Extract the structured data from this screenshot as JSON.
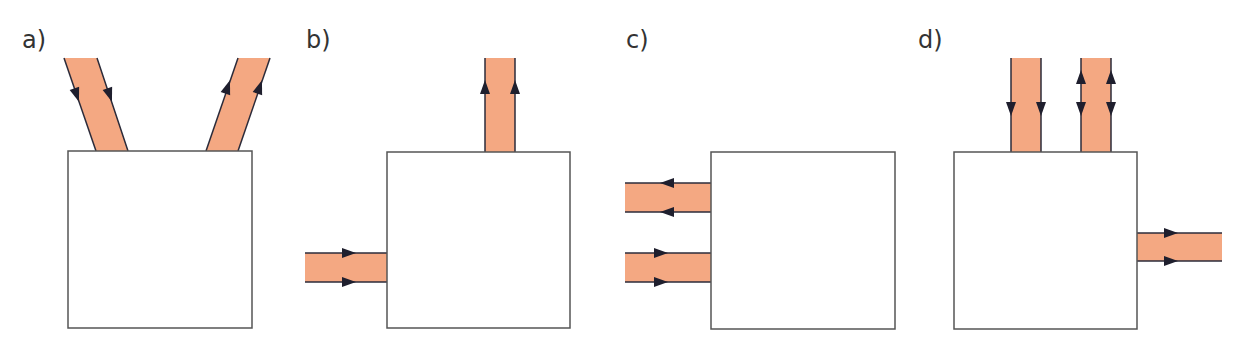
{
  "heading": {
    "text": "…"
  },
  "colors": {
    "pipe_fill": "#F4A882",
    "pipe_edge": "#2b2b3a",
    "box_border": "#555555",
    "arrow": "#1f1f2e",
    "label": "#333333"
  },
  "panels": [
    {
      "id": "a",
      "label": "a)",
      "label_x": 22,
      "box": {
        "x": 68,
        "y": 151,
        "w": 184,
        "h": 177
      },
      "pipes": [
        {
          "name": "angled-inlet-left",
          "polygon": "64,58 97,58 128,151 96,151",
          "direction": "in",
          "arrows": "down"
        },
        {
          "name": "angled-outlet-right",
          "polygon": "238,58 270,58 238,151 206,151",
          "direction": "out",
          "arrows": "up"
        }
      ]
    },
    {
      "id": "b",
      "label": "b)",
      "label_x": 306,
      "box": {
        "x": 387,
        "y": 152,
        "w": 183,
        "h": 176
      },
      "pipes": [
        {
          "name": "top-outlet",
          "x": 485,
          "y": 58,
          "w": 30,
          "h": 94,
          "direction": "out",
          "arrows": "up"
        },
        {
          "name": "left-inlet",
          "x": 305,
          "y": 253,
          "w": 82,
          "h": 29,
          "direction": "in",
          "arrows": "right"
        }
      ]
    },
    {
      "id": "c",
      "label": "c)",
      "label_x": 626,
      "box": {
        "x": 711,
        "y": 152,
        "w": 184,
        "h": 177
      },
      "pipes": [
        {
          "name": "left-outlet-upper",
          "x": 625,
          "y": 183,
          "w": 86,
          "h": 29,
          "direction": "out",
          "arrows": "left"
        },
        {
          "name": "left-inlet-lower",
          "x": 625,
          "y": 253,
          "w": 86,
          "h": 29,
          "direction": "in",
          "arrows": "right"
        }
      ]
    },
    {
      "id": "d",
      "label": "d)",
      "label_x": 918,
      "box": {
        "x": 954,
        "y": 152,
        "w": 183,
        "h": 177
      },
      "pipes": [
        {
          "name": "top-inlet",
          "x": 1011,
          "y": 58,
          "w": 30,
          "h": 94,
          "direction": "in",
          "arrows": "down"
        },
        {
          "name": "top-bidirectional",
          "x": 1081,
          "y": 58,
          "w": 30,
          "h": 94,
          "direction": "both",
          "arrows": "up-and-down"
        },
        {
          "name": "right-outlet",
          "x": 1137,
          "y": 233,
          "w": 85,
          "h": 28,
          "direction": "out",
          "arrows": "right"
        }
      ]
    }
  ]
}
